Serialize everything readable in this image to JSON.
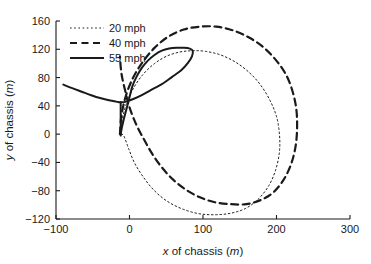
{
  "chart_data": {
    "type": "line",
    "title": "",
    "xlabel": "x of chassis (m)",
    "ylabel": "y of chassis (m)",
    "xlabel_parts": {
      "var": "x",
      "mid": " of chassis (",
      "unit": "m",
      "close": ")"
    },
    "ylabel_parts": {
      "var": "y",
      "mid": " of chassis (",
      "unit": "m",
      "close": ")"
    },
    "xlim": [
      -100,
      300
    ],
    "ylim": [
      -120,
      160
    ],
    "xticks": [
      -100,
      0,
      100,
      200,
      300
    ],
    "xtick_labels": [
      "−100",
      "0",
      "100",
      "200",
      "300"
    ],
    "yticks": [
      -120,
      -80,
      -40,
      0,
      40,
      80,
      120,
      160
    ],
    "ytick_labels": [
      "−120",
      "−80",
      "−40",
      "0",
      "40",
      "80",
      "120",
      "160"
    ],
    "grid": false,
    "legend_position": "upper-left",
    "legend": [
      {
        "label": "20 mph",
        "style": "dotted",
        "color": "#1a1a1a",
        "width": 1.0
      },
      {
        "label": "40 mph",
        "style": "dashed",
        "color": "#1a1a1a",
        "width": 2.2
      },
      {
        "label": "55 mph",
        "style": "solid",
        "color": "#1a1a1a",
        "width": 2.0
      }
    ],
    "series": [
      {
        "name": "20 mph",
        "style": "dotted",
        "points": [
          [
            -13,
            0
          ],
          [
            -10,
            20
          ],
          [
            -4,
            44
          ],
          [
            6,
            66
          ],
          [
            18,
            84
          ],
          [
            33,
            99
          ],
          [
            50,
            110
          ],
          [
            68,
            116
          ],
          [
            86,
            118
          ],
          [
            104,
            117
          ],
          [
            124,
            112
          ],
          [
            144,
            102
          ],
          [
            162,
            88
          ],
          [
            178,
            70
          ],
          [
            191,
            48
          ],
          [
            200,
            25
          ],
          [
            204,
            0
          ],
          [
            204,
            -25
          ],
          [
            199,
            -50
          ],
          [
            190,
            -72
          ],
          [
            176,
            -91
          ],
          [
            158,
            -105
          ],
          [
            137,
            -112
          ],
          [
            114,
            -114
          ],
          [
            92,
            -112
          ],
          [
            70,
            -105
          ],
          [
            50,
            -94
          ],
          [
            33,
            -79
          ],
          [
            19,
            -61
          ],
          [
            7,
            -41
          ],
          [
            -1,
            -21
          ],
          [
            -8,
            -2
          ],
          [
            -13,
            0
          ]
        ]
      },
      {
        "name": "40 mph",
        "style": "dashed",
        "points": [
          [
            -13,
            0
          ],
          [
            -11,
            26
          ],
          [
            -5,
            54
          ],
          [
            5,
            80
          ],
          [
            18,
            102
          ],
          [
            34,
            122
          ],
          [
            53,
            138
          ],
          [
            74,
            148
          ],
          [
            96,
            152
          ],
          [
            118,
            152
          ],
          [
            140,
            147
          ],
          [
            162,
            137
          ],
          [
            182,
            123
          ],
          [
            199,
            105
          ],
          [
            213,
            84
          ],
          [
            222,
            60
          ],
          [
            227,
            35
          ],
          [
            228,
            9
          ],
          [
            226,
            -17
          ],
          [
            220,
            -42
          ],
          [
            210,
            -64
          ],
          [
            196,
            -82
          ],
          [
            179,
            -93
          ],
          [
            159,
            -99
          ],
          [
            137,
            -99
          ],
          [
            115,
            -96
          ],
          [
            95,
            -89
          ],
          [
            76,
            -78
          ],
          [
            59,
            -64
          ],
          [
            44,
            -47
          ],
          [
            31,
            -28
          ],
          [
            20,
            -8
          ],
          [
            9,
            14
          ],
          [
            0,
            38
          ],
          [
            -6,
            62
          ],
          [
            -11,
            86
          ],
          [
            -13,
            110
          ]
        ]
      },
      {
        "name": "55 mph",
        "style": "solid",
        "points": [
          [
            -90,
            70
          ],
          [
            -78,
            65
          ],
          [
            -65,
            60
          ],
          [
            -52,
            55
          ],
          [
            -40,
            51
          ],
          [
            -28,
            48
          ],
          [
            -18,
            46
          ],
          [
            -12,
            45
          ],
          [
            -4,
            46
          ],
          [
            6,
            50
          ],
          [
            18,
            56
          ],
          [
            32,
            64
          ],
          [
            46,
            72
          ],
          [
            58,
            81
          ],
          [
            70,
            90
          ],
          [
            79,
            100
          ],
          [
            85,
            110
          ],
          [
            86,
            118
          ],
          [
            82,
            121
          ],
          [
            74,
            122
          ],
          [
            64,
            122
          ],
          [
            54,
            121
          ],
          [
            44,
            118
          ],
          [
            34,
            112
          ],
          [
            25,
            104
          ],
          [
            17,
            94
          ],
          [
            10,
            82
          ],
          [
            4,
            68
          ],
          [
            0,
            52
          ],
          [
            -4,
            36
          ],
          [
            -8,
            20
          ],
          [
            -11,
            6
          ],
          [
            -12,
            -2
          ]
        ],
        "segments": [
          {
            "comment": "vertical tail from loop bottom down through y=0",
            "points": [
              [
                -12,
                45
              ],
              [
                -12,
                20
              ],
              [
                -12,
                0
              ]
            ]
          }
        ]
      }
    ]
  },
  "axes": {
    "x_axis_name": "x-axis",
    "y_axis_name": "y-axis"
  }
}
